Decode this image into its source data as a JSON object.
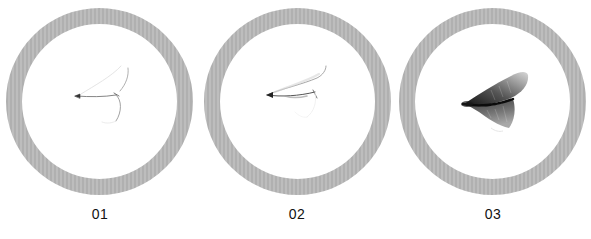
{
  "steps": [
    {
      "label": "01",
      "stage": "initial-outline",
      "description": "Light outline sketch of lips"
    },
    {
      "label": "02",
      "stage": "refined-outline",
      "description": "Refined line with light shading"
    },
    {
      "label": "03",
      "stage": "full-shading",
      "description": "Fully shaded lips"
    }
  ],
  "colors": {
    "background": "#ffffff",
    "ring": "#b5b5b5",
    "ring_light": "#c8c8c8",
    "label": "#111111",
    "sketch_dark": "#2a2a2a",
    "sketch_light": "#bdbdbd"
  }
}
